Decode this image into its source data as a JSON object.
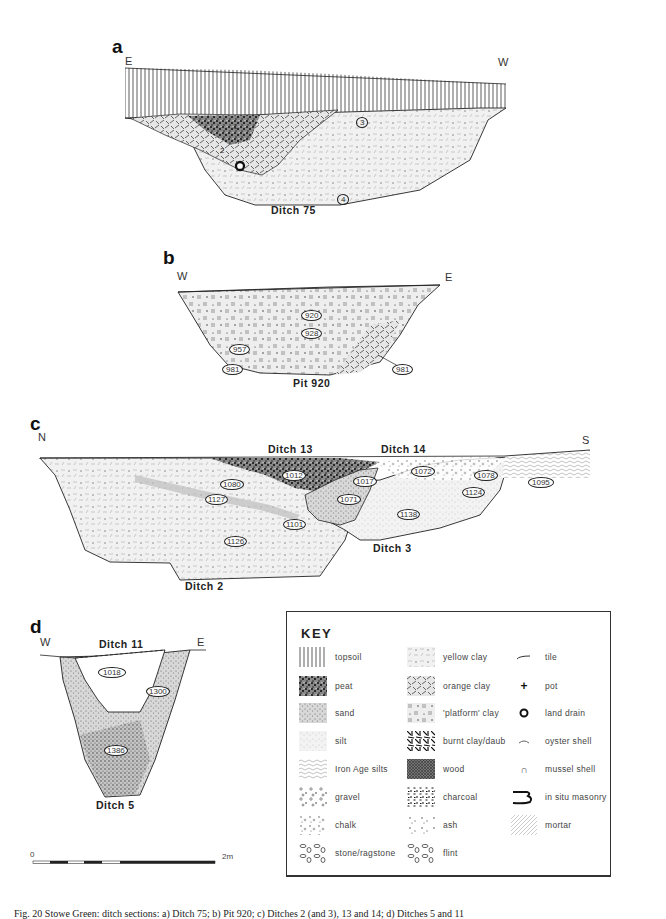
{
  "figure": {
    "caption": "Fig. 20 Stowe Green: ditch sections: a) Ditch 75; b) Pit 920; c) Ditches 2 (and 3), 13 and 14; d) Ditches 5 and 11"
  },
  "panels": {
    "a": {
      "letter": "a",
      "left_dir": "E",
      "right_dir": "W",
      "section_label": "Ditch 75",
      "contexts": [
        "1",
        "2",
        "3",
        "4"
      ]
    },
    "b": {
      "letter": "b",
      "left_dir": "W",
      "right_dir": "E",
      "section_label": "Pit 920",
      "contexts": [
        "920",
        "928",
        "957",
        "981",
        "981"
      ]
    },
    "c": {
      "letter": "c",
      "left_dir": "N",
      "right_dir": "S",
      "labels": [
        "Ditch 13",
        "Ditch 14",
        "Ditch 3",
        "Ditch 2"
      ],
      "contexts": [
        "1012",
        "1080",
        "1127",
        "1017",
        "1071",
        "1072",
        "1078",
        "1124",
        "1095",
        "1138",
        "1101",
        "1126"
      ]
    },
    "d": {
      "letter": "d",
      "left_dir": "W",
      "right_dir": "E",
      "top_label": "Ditch 11",
      "section_label": "Ditch 5",
      "contexts": [
        "1018",
        "1300",
        "1386"
      ]
    }
  },
  "scale": {
    "start": "0",
    "end": "2m"
  },
  "key": {
    "title": "KEY",
    "column1": [
      {
        "label": "topsoil",
        "pattern": "vertical-lines"
      },
      {
        "label": "peat",
        "pattern": "dense-dark-speckle"
      },
      {
        "label": "sand",
        "pattern": "fine-stipple"
      },
      {
        "label": "silt",
        "pattern": "light-stipple"
      },
      {
        "label": "Iron Age silts",
        "pattern": "wavy-lines"
      },
      {
        "label": "gravel",
        "pattern": "small-pebbles"
      },
      {
        "label": "chalk",
        "pattern": "scattered-dots"
      },
      {
        "label": "stone/ragstone",
        "pattern": "stones"
      }
    ],
    "column2": [
      {
        "label": "yellow clay",
        "pattern": "light-dashes"
      },
      {
        "label": "orange clay",
        "pattern": "diagonal-dashes"
      },
      {
        "label": "'platform' clay",
        "pattern": "triple-bars"
      },
      {
        "label": "burnt clay/daub",
        "pattern": "heavy-dashes"
      },
      {
        "label": "wood",
        "pattern": "dark-cross-hatch"
      },
      {
        "label": "charcoal",
        "pattern": "dark-flecks"
      },
      {
        "label": "ash",
        "pattern": "ash-flecks"
      },
      {
        "label": "flint",
        "pattern": "flint-nodules"
      }
    ],
    "column3": [
      {
        "label": "tile",
        "symbol": "tile-icon"
      },
      {
        "label": "pot",
        "symbol": "pot-icon",
        "glyph": "+"
      },
      {
        "label": "land drain",
        "symbol": "land-drain-icon"
      },
      {
        "label": "oyster shell",
        "symbol": "oyster-shell-icon"
      },
      {
        "label": "mussel shell",
        "symbol": "mussel-shell-icon",
        "glyph": "∩"
      },
      {
        "label": "in situ masonry",
        "symbol": "masonry-icon"
      },
      {
        "label": "mortar",
        "symbol": "mortar-icon"
      }
    ]
  },
  "colors": {
    "ink": "#222222",
    "fill_light": "#ececec",
    "fill_mid": "#d6d6d6",
    "fill_dark": "#555555"
  }
}
